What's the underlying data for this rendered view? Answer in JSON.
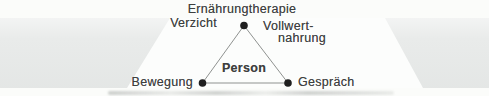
{
  "diagram": {
    "type": "triangle-concept-diagram",
    "labels": {
      "title": "Ernährungtherapie",
      "verzicht": "Verzicht",
      "vollwert_line1": "Vollwert-",
      "vollwert_line2": "nahrung",
      "bewegung": "Bewegung",
      "gespraech": "Gespräch",
      "person": "Person"
    }
  },
  "colors": {
    "page": "#fbfcfa",
    "band": "#e9ebea",
    "panel": "#fcfdfc",
    "text": "#3e403f",
    "line": "#8f9290",
    "dot": "#1f1f1f"
  }
}
